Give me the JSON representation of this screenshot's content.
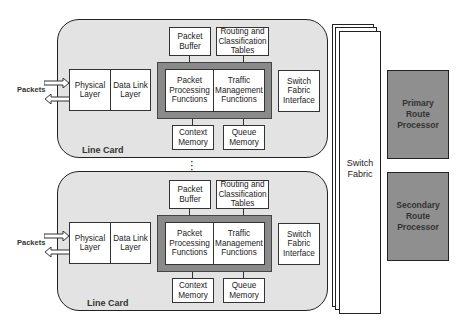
{
  "diagram": {
    "line_cards": [
      {
        "label": "Line Card",
        "external_label": "Packets",
        "blocks": {
          "physical_layer": "Physical\nLayer",
          "data_link_layer": "Data Link\nLayer",
          "packet_buffer": "Packet\nBuffer",
          "routing_tables": "Routing and\nClassification\nTables",
          "packet_processing": "Packet\nProcessing\nFunctions",
          "traffic_management": "Traffic\nManagement\nFunctions",
          "context_memory": "Context\nMemory",
          "queue_memory": "Queue\nMemory",
          "switch_fabric_interface": "Switch\nFabric\nInterface"
        }
      },
      {
        "label": "Line Card",
        "external_label": "Packets",
        "blocks": {
          "physical_layer": "Physical\nLayer",
          "data_link_layer": "Data Link\nLayer",
          "packet_buffer": "Packet\nBuffer",
          "routing_tables": "Routing and\nClassification\nTables",
          "packet_processing": "Packet\nProcessing\nFunctions",
          "traffic_management": "Traffic\nManagement\nFunctions",
          "context_memory": "Context\nMemory",
          "queue_memory": "Queue\nMemory",
          "switch_fabric_interface": "Switch\nFabric\nInterface"
        }
      }
    ],
    "ellipsis": "⋮",
    "switch_fabric": "Switch\nFabric",
    "primary_route_processor": "Primary\nRoute\nProcessor",
    "secondary_route_processor": "Secondary\nRoute\nProcessor",
    "colors": {
      "line_card_fill": "#e3e3e3",
      "processing_frame": "#8a8a8a",
      "route_processor_fill": "#8f8f8f",
      "box_fill": "#ffffff",
      "stroke": "#222222"
    }
  }
}
